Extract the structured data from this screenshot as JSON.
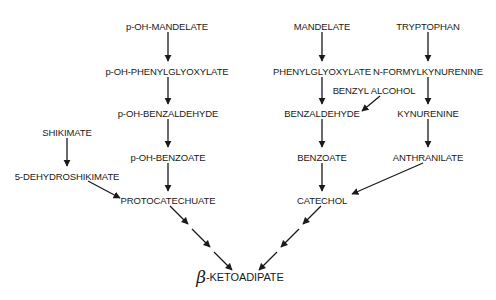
{
  "diagram": {
    "type": "metabolic-pathway",
    "nodes": [
      {
        "id": "p_oh_mandelate",
        "label": "p-OH-MANDELATE",
        "x": 167,
        "y": 26
      },
      {
        "id": "p_oh_phenylglyoxylate",
        "label": "p-OH-PHENYLGLYOXYLATE",
        "x": 167,
        "y": 71
      },
      {
        "id": "p_oh_benzaldehyde",
        "label": "p-OH-BENZALDEHYDE",
        "x": 168,
        "y": 113
      },
      {
        "id": "p_oh_benzoate",
        "label": "p-OH-BENZOATE",
        "x": 168,
        "y": 157
      },
      {
        "id": "protocatechuate",
        "label": "PROTOCATECHUATE",
        "x": 168,
        "y": 200
      },
      {
        "id": "shikimate",
        "label": "SHIKIMATE",
        "x": 67,
        "y": 132
      },
      {
        "id": "dehydroshikimate",
        "label": "5-DEHYDROSHIKIMATE",
        "x": 67,
        "y": 176
      },
      {
        "id": "mandelate",
        "label": "MANDELATE",
        "x": 322,
        "y": 26
      },
      {
        "id": "phenylglyoxylate",
        "label": "PHENYLGLYOXYLATE",
        "x": 322,
        "y": 71
      },
      {
        "id": "benzyl_alcohol",
        "label": "BENZYL ALCOHOL",
        "x": 374,
        "y": 90
      },
      {
        "id": "benzaldehyde",
        "label": "BENZALDEHYDE",
        "x": 322,
        "y": 113
      },
      {
        "id": "benzoate",
        "label": "BENZOATE",
        "x": 322,
        "y": 157
      },
      {
        "id": "catechol",
        "label": "CATECHOL",
        "x": 322,
        "y": 200
      },
      {
        "id": "tryptophan",
        "label": "TRYPTOPHAN",
        "x": 428,
        "y": 26
      },
      {
        "id": "n_formylkynurenine",
        "label": "N-FORMYLKYNURENINE",
        "x": 428,
        "y": 71
      },
      {
        "id": "kynurenine",
        "label": "KYNURENINE",
        "x": 428,
        "y": 113
      },
      {
        "id": "anthranilate",
        "label": "ANTHRANILATE",
        "x": 428,
        "y": 157
      }
    ],
    "final": {
      "id": "beta_ketoadipate",
      "beta": "β",
      "label": "-KETOADIPATE",
      "x": 235,
      "y": 277
    },
    "edges": [
      {
        "from": "p_oh_mandelate",
        "to": "p_oh_phenylglyoxylate",
        "style": "solid"
      },
      {
        "from": "p_oh_phenylglyoxylate",
        "to": "p_oh_benzaldehyde",
        "style": "solid"
      },
      {
        "from": "p_oh_benzaldehyde",
        "to": "p_oh_benzoate",
        "style": "solid"
      },
      {
        "from": "p_oh_benzoate",
        "to": "protocatechuate",
        "style": "solid"
      },
      {
        "from": "shikimate",
        "to": "dehydroshikimate",
        "style": "solid"
      },
      {
        "from": "dehydroshikimate",
        "to": "protocatechuate",
        "style": "solid"
      },
      {
        "from": "mandelate",
        "to": "phenylglyoxylate",
        "style": "solid"
      },
      {
        "from": "phenylglyoxylate",
        "to": "benzaldehyde",
        "style": "solid"
      },
      {
        "from": "benzyl_alcohol",
        "to": "benzaldehyde",
        "style": "solid"
      },
      {
        "from": "benzaldehyde",
        "to": "benzoate",
        "style": "solid"
      },
      {
        "from": "benzoate",
        "to": "catechol",
        "style": "solid"
      },
      {
        "from": "tryptophan",
        "to": "n_formylkynurenine",
        "style": "solid"
      },
      {
        "from": "n_formylkynurenine",
        "to": "kynurenine",
        "style": "solid"
      },
      {
        "from": "kynurenine",
        "to": "anthranilate",
        "style": "solid"
      },
      {
        "from": "anthranilate",
        "to": "catechol",
        "style": "solid"
      },
      {
        "from": "protocatechuate",
        "to": "beta_ketoadipate",
        "style": "multi-step"
      },
      {
        "from": "catechol",
        "to": "beta_ketoadipate",
        "style": "multi-step"
      }
    ],
    "colors": {
      "ink": "#1a1a1a",
      "background": "#ffffff"
    }
  }
}
